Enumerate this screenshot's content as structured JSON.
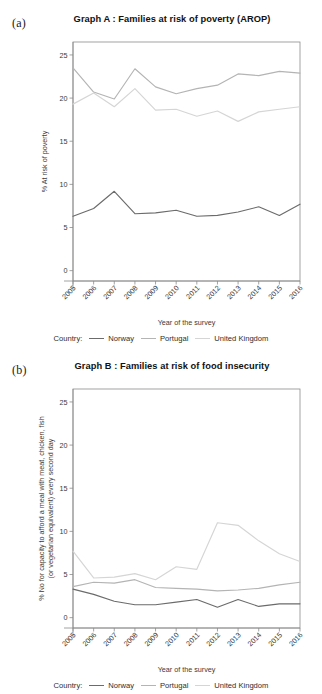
{
  "figure": {
    "panel_a_letter": "(a)",
    "panel_b_letter": "(b)"
  },
  "legend": {
    "title": "Country:",
    "entries": [
      {
        "label": "Norway",
        "color": "#6b6b6b"
      },
      {
        "label": "Portugal",
        "color": "#b4b4b4"
      },
      {
        "label": "United Kingdom",
        "color": "#d5d5d5"
      }
    ]
  },
  "chart_data": [
    {
      "type": "line",
      "id": "graph-a",
      "title": "Graph A : Families at risk of poverty (AROP)",
      "xlabel": "Year of the survey",
      "ylabel": "% At risk of poverty",
      "categories": [
        2005,
        2006,
        2007,
        2008,
        2009,
        2010,
        2011,
        2012,
        2013,
        2014,
        2015,
        2016
      ],
      "xticklabels": [
        "2005",
        "2006",
        "2007",
        "2008",
        "2009",
        "2010",
        "2011",
        "2012",
        "2013",
        "2014",
        "2015",
        "2016"
      ],
      "yticks": [
        0,
        5,
        10,
        15,
        20,
        25
      ],
      "yticklabels": [
        "0",
        "5",
        "10",
        "15",
        "20",
        "25"
      ],
      "ylim": [
        -1.2,
        26.5
      ],
      "grid": false,
      "legend_position": "bottom",
      "series": [
        {
          "name": "Norway",
          "color": "#6b6b6b",
          "values": [
            6.3,
            7.2,
            9.2,
            6.6,
            6.7,
            7.0,
            6.3,
            6.4,
            6.8,
            7.4,
            6.4,
            7.7
          ]
        },
        {
          "name": "Portugal",
          "color": "#b4b4b4",
          "values": [
            23.5,
            20.7,
            19.9,
            23.4,
            21.3,
            20.5,
            21.1,
            21.5,
            22.8,
            22.6,
            23.1,
            22.9
          ]
        },
        {
          "name": "United Kingdom",
          "color": "#d5d5d5",
          "values": [
            19.3,
            20.6,
            19.0,
            21.1,
            18.6,
            18.7,
            17.9,
            18.5,
            17.3,
            18.4,
            18.7,
            19.0
          ]
        }
      ]
    },
    {
      "type": "line",
      "id": "graph-b",
      "title": "Graph B : Families at risk of food insecurity",
      "xlabel": "Year of the survey",
      "ylabel": "% No for capacity to afford a meal with meat, chicken, fish (or vegetarian equivalent) every second day",
      "ylabel_line1": "% No for capacity to afford a meal with meat, chicken, fish",
      "ylabel_line2": "(or vegetarian equivalent) every second day",
      "categories": [
        2005,
        2006,
        2007,
        2008,
        2009,
        2010,
        2011,
        2012,
        2013,
        2014,
        2015,
        2016
      ],
      "xticklabels": [
        "2005",
        "2006",
        "2007",
        "2008",
        "2009",
        "2010",
        "2011",
        "2012",
        "2013",
        "2014",
        "2015",
        "2016"
      ],
      "yticks": [
        0,
        5,
        10,
        15,
        20,
        25
      ],
      "yticklabels": [
        "0",
        "5",
        "10",
        "15",
        "20",
        "25"
      ],
      "ylim": [
        -1.2,
        26.5
      ],
      "grid": false,
      "legend_position": "bottom",
      "series": [
        {
          "name": "Norway",
          "color": "#6b6b6b",
          "values": [
            3.3,
            2.7,
            1.9,
            1.5,
            1.5,
            1.8,
            2.1,
            1.2,
            2.1,
            1.3,
            1.6,
            1.6
          ]
        },
        {
          "name": "Portugal",
          "color": "#b4b4b4",
          "values": [
            3.6,
            4.1,
            4.0,
            4.4,
            3.5,
            3.4,
            3.3,
            3.1,
            3.2,
            3.4,
            3.8,
            4.1
          ]
        },
        {
          "name": "United Kingdom",
          "color": "#d5d5d5",
          "values": [
            7.7,
            4.6,
            4.7,
            5.1,
            4.4,
            5.9,
            5.6,
            11.0,
            10.7,
            8.9,
            7.4,
            6.5
          ]
        }
      ]
    }
  ]
}
